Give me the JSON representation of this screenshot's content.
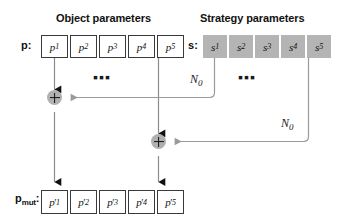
{
  "figure": {
    "headers": {
      "object": "Object parameters",
      "strategy": "Strategy parameters"
    },
    "vectors": {
      "p_label": "p",
      "p_colon": ":",
      "s_label": "s",
      "s_colon": ":",
      "pmut_label": "p",
      "pmut_sub": "mut",
      "pmut_colon": ":"
    },
    "object_cells": [
      {
        "base": "p",
        "sub": "1"
      },
      {
        "base": "p",
        "sub": "2"
      },
      {
        "base": "p",
        "sub": "3"
      },
      {
        "base": "p",
        "sub": "4"
      },
      {
        "base": "p",
        "sub": "5"
      }
    ],
    "strategy_cells": [
      {
        "base": "s",
        "sub": "1"
      },
      {
        "base": "s",
        "sub": "2"
      },
      {
        "base": "s",
        "sub": "3"
      },
      {
        "base": "s",
        "sub": "4"
      },
      {
        "base": "s",
        "sub": "5"
      }
    ],
    "mutated_cells": [
      {
        "base": "p",
        "sub": "1",
        "prime": "′"
      },
      {
        "base": "p",
        "sub": "2",
        "prime": "′"
      },
      {
        "base": "p",
        "sub": "3",
        "prime": "′"
      },
      {
        "base": "p",
        "sub": "4",
        "prime": "′"
      },
      {
        "base": "p",
        "sub": "5",
        "prime": "′"
      }
    ],
    "ellipses": {
      "object": "▪▪▪",
      "strategy": "▪▪▪"
    },
    "noise_labels": [
      {
        "base": "N",
        "sub": "0"
      },
      {
        "base": "N",
        "sub": "0"
      }
    ],
    "operators": [
      {
        "symbol": "+",
        "name": "add-node-1"
      },
      {
        "symbol": "+",
        "name": "add-node-2"
      }
    ],
    "colors": {
      "strategy_fill": "#b4b4b4",
      "operator_fill": "#b0b0b0",
      "wire": "#8c8c8c",
      "arrow_dark": "#111111",
      "cell_border": "#3a3a3a"
    }
  }
}
